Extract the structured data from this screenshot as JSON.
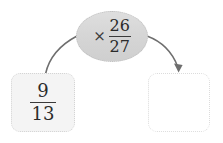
{
  "diagram": {
    "type": "fraction-multiplication-flow",
    "operator_node": {
      "operator_symbol": "×",
      "operator_icon": "multiply-icon",
      "fraction": {
        "numerator": "26",
        "denominator": "27"
      }
    },
    "input_cell": {
      "fraction": {
        "numerator": "9",
        "denominator": "13"
      }
    },
    "output_cell": {
      "value": "",
      "placeholder": ""
    },
    "connectors": [
      {
        "name": "input-to-operator-curve",
        "has_arrowhead": false
      },
      {
        "name": "operator-to-output-arrow",
        "has_arrowhead": true
      }
    ],
    "colors": {
      "background": "#ffffff",
      "ellipse_fill": "#d6d6d6",
      "ellipse_border": "#bdbdbd",
      "input_cell_fill": "#f4f4f4",
      "cell_border": "#d9d9d9",
      "arrow_stroke": "#6e6e6e",
      "text": "#2b2b2b"
    }
  }
}
